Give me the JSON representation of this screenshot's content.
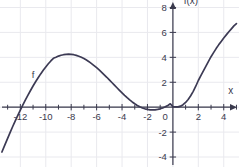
{
  "chart_data": {
    "type": "line",
    "title": "",
    "subtitle": "",
    "xlabel": "x",
    "ylabel": "f(x)",
    "xlim": [
      -13.6,
      5.2
    ],
    "ylim": [
      -4.8,
      8.6
    ],
    "xticks": [
      -12,
      -10,
      -8,
      -6,
      -4,
      -2,
      0,
      2,
      4
    ],
    "xtick_labels": [
      "-12",
      "-10",
      "-8",
      "-6",
      "-4",
      "-2",
      "0",
      "2",
      "4"
    ],
    "yticks": [
      -4,
      -2,
      0,
      2,
      4,
      6,
      8
    ],
    "ytick_labels": [
      "-4",
      "-2",
      "0",
      "2",
      "4",
      "6",
      "8"
    ],
    "xtick_minor_step": 1,
    "grid": true,
    "grid_step_x": 2,
    "grid_step_y": 2,
    "legend": null,
    "legend_position": "none",
    "annotations": [
      {
        "text": "f",
        "x": -11.1,
        "y": 2.35,
        "note": "curve name label beside rising left branch"
      },
      {
        "text": "f(x)",
        "x": 0.85,
        "y": 8.25,
        "note": "y-axis title at top of vertical axis"
      },
      {
        "text": "x",
        "x": 4.35,
        "y": 1.05,
        "note": "x-axis title at right end of horizontal axis"
      }
    ],
    "series": [
      {
        "name": "f",
        "color": "#3c3a54",
        "line_width": 1.7,
        "points": [
          [
            -13.45,
            -3.6
          ],
          [
            -13.2,
            -2.98
          ],
          [
            -13.0,
            -2.5
          ],
          [
            -12.8,
            -2.02
          ],
          [
            -12.6,
            -1.55
          ],
          [
            -12.4,
            -1.1
          ],
          [
            -12.2,
            -0.66
          ],
          [
            -12.0,
            -0.23
          ],
          [
            -11.8,
            0.18
          ],
          [
            -11.6,
            0.58
          ],
          [
            -11.4,
            0.97
          ],
          [
            -11.2,
            1.34
          ],
          [
            -11.0,
            1.7
          ],
          [
            -10.8,
            2.04
          ],
          [
            -10.6,
            2.36
          ],
          [
            -10.4,
            2.67
          ],
          [
            -10.2,
            2.96
          ],
          [
            -10.0,
            3.23
          ],
          [
            -9.8,
            3.48
          ],
          [
            -9.6,
            3.71
          ],
          [
            -9.4,
            3.92
          ],
          [
            -9.2,
            4.0
          ],
          [
            -9.0,
            4.1
          ],
          [
            -8.8,
            4.17
          ],
          [
            -8.6,
            4.21
          ],
          [
            -8.4,
            4.24
          ],
          [
            -8.2,
            4.25
          ],
          [
            -8.0,
            4.24
          ],
          [
            -7.8,
            4.21
          ],
          [
            -7.6,
            4.16
          ],
          [
            -7.4,
            4.09
          ],
          [
            -7.2,
            4.0
          ],
          [
            -7.0,
            3.9
          ],
          [
            -6.8,
            3.78
          ],
          [
            -6.6,
            3.65
          ],
          [
            -6.4,
            3.5
          ],
          [
            -6.2,
            3.34
          ],
          [
            -6.0,
            3.17
          ],
          [
            -5.8,
            2.99
          ],
          [
            -5.6,
            2.8
          ],
          [
            -5.4,
            2.6
          ],
          [
            -5.2,
            2.4
          ],
          [
            -5.0,
            2.19
          ],
          [
            -4.8,
            1.98
          ],
          [
            -4.6,
            1.77
          ],
          [
            -4.4,
            1.56
          ],
          [
            -4.2,
            1.35
          ],
          [
            -4.0,
            1.15
          ],
          [
            -3.8,
            0.95
          ],
          [
            -3.6,
            0.76
          ],
          [
            -3.4,
            0.58
          ],
          [
            -3.2,
            0.42
          ],
          [
            -3.0,
            0.27
          ],
          [
            -2.8,
            0.14
          ],
          [
            -2.6,
            0.03
          ],
          [
            -2.4,
            -0.06
          ],
          [
            -2.2,
            -0.13
          ],
          [
            -2.0,
            -0.18
          ],
          [
            -1.8,
            -0.21
          ],
          [
            -1.6,
            -0.22
          ],
          [
            -1.4,
            -0.21
          ],
          [
            -1.2,
            -0.18
          ],
          [
            -1.0,
            -0.13
          ],
          [
            -0.8,
            -0.06
          ],
          [
            -0.6,
            0.03
          ],
          [
            -0.4,
            0.14
          ],
          [
            -0.2,
            0.27
          ],
          [
            0.0,
            0.05
          ],
          [
            0.2,
            0.02
          ],
          [
            0.4,
            0.02
          ],
          [
            0.6,
            0.08
          ],
          [
            0.8,
            0.2
          ],
          [
            1.0,
            0.38
          ],
          [
            1.2,
            0.62
          ],
          [
            1.4,
            0.92
          ],
          [
            1.6,
            1.27
          ],
          [
            1.8,
            1.68
          ],
          [
            2.0,
            2.14
          ],
          [
            2.2,
            2.54
          ],
          [
            2.4,
            2.92
          ],
          [
            2.6,
            3.3
          ],
          [
            2.8,
            3.68
          ],
          [
            3.0,
            4.05
          ],
          [
            3.2,
            4.38
          ],
          [
            3.4,
            4.7
          ],
          [
            3.6,
            5.0
          ],
          [
            3.8,
            5.28
          ],
          [
            4.0,
            5.55
          ],
          [
            4.2,
            5.8
          ],
          [
            4.4,
            6.05
          ],
          [
            4.6,
            6.28
          ],
          [
            4.8,
            6.52
          ],
          [
            5.0,
            6.7
          ]
        ]
      }
    ],
    "colors": {
      "curve": "#3c3a54",
      "axis": "#3a3a4d",
      "grid": "#e9e9ee",
      "text": "#3a3a4d",
      "background": "#ffffff"
    }
  }
}
